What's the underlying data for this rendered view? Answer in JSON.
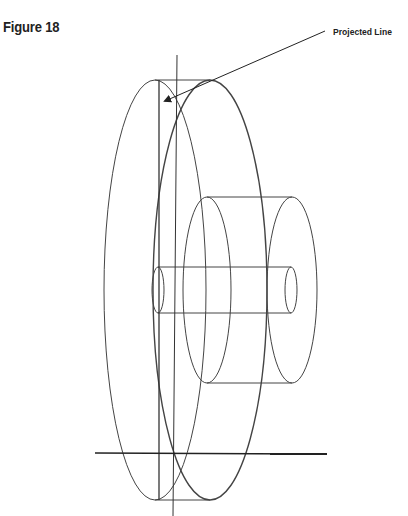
{
  "figure": {
    "title": "Figure 18",
    "callout_label": "Projected Line"
  },
  "colors": {
    "line": "#444444",
    "ground_line": "#222222",
    "background": "#ffffff"
  },
  "shapes": {
    "disc_front_ellipse": {
      "cx": 155,
      "cy": 290,
      "rx": 51,
      "ry": 210
    },
    "disc_back_ellipse": {
      "cx": 210,
      "cy": 290,
      "rx": 57,
      "ry": 210
    },
    "hub_left_ellipse": {
      "cx": 207,
      "cy": 290,
      "rx": 24,
      "ry": 93
    },
    "hub_right_ellipse": {
      "cx": 292,
      "cy": 290,
      "rx": 25,
      "ry": 93
    },
    "shaft_left_ellipse": {
      "cx": 158,
      "cy": 290,
      "rx": 6,
      "ry": 23
    },
    "shaft_right_ellipse": {
      "cx": 291,
      "cy": 290,
      "rx": 6,
      "ry": 23
    }
  }
}
